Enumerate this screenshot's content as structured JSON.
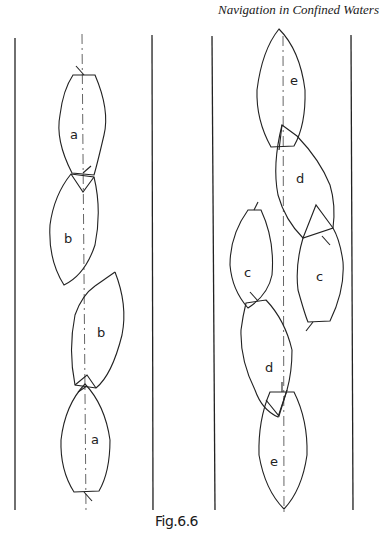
{
  "header": {
    "running_title": "Navigation in Confined Waters"
  },
  "figure": {
    "caption": "Fig.6.6",
    "left_channel": {
      "vessels": [
        {
          "label": "a",
          "position": "upper"
        },
        {
          "label": "b",
          "position": "upper"
        },
        {
          "label": "b",
          "position": "lower"
        },
        {
          "label": "a",
          "position": "lower"
        }
      ]
    },
    "right_channel": {
      "vessels": [
        {
          "label": "e",
          "position": "upper"
        },
        {
          "label": "d",
          "position": "upper"
        },
        {
          "label": "c",
          "position": "upper-left"
        },
        {
          "label": "c",
          "position": "upper-right"
        },
        {
          "label": "d",
          "position": "lower"
        },
        {
          "label": "e",
          "position": "lower"
        }
      ]
    }
  },
  "colors": {
    "ink": "#222222",
    "paper": "#ffffff"
  }
}
